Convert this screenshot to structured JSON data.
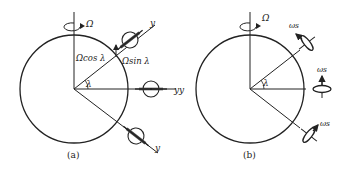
{
  "figure": {
    "panel_a": {
      "caption": "(a)",
      "rotation_label": "Ω",
      "vertical_component": "Ωcos λ",
      "horizontal_component": "Ωsin λ",
      "angle_label": "λ",
      "axis_labels": [
        "y",
        "y",
        "y"
      ]
    },
    "panel_b": {
      "caption": "(b)",
      "rotation_label": "Ω",
      "angle_label": "λ",
      "spin_labels": [
        "ωs",
        "ωs",
        "ωs"
      ],
      "axis_label": "y"
    },
    "colors": {
      "stroke": "#222222",
      "background": "#ffffff"
    }
  }
}
